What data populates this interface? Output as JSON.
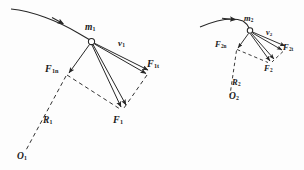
{
  "figure": {
    "background_color": "#fdfdfd",
    "stroke_color": "#262626",
    "label_color": "#1a1a1a"
  },
  "system_1": {
    "mass_label": "m",
    "mass_sub": "1",
    "velocity_label": "v",
    "velocity_sub": "1",
    "force_tangential_label": "F",
    "force_tangential_sub": "1t",
    "force_normal_label": "F",
    "force_normal_sub": "1n",
    "force_resultant_label": "F",
    "force_resultant_sub": "1",
    "radius_label": "R",
    "radius_sub": "1",
    "center_label": "O",
    "center_sub": "1"
  },
  "system_2": {
    "mass_label": "m",
    "mass_sub": "2",
    "velocity_label": "v",
    "velocity_sub": "2",
    "force_tangential_label": "F",
    "force_tangential_sub": "2t",
    "force_normal_label": "F",
    "force_normal_sub": "2n",
    "force_resultant_label": "F",
    "force_resultant_sub": "2",
    "radius_label": "R",
    "radius_sub": "2",
    "center_label": "O",
    "center_sub": "2"
  }
}
